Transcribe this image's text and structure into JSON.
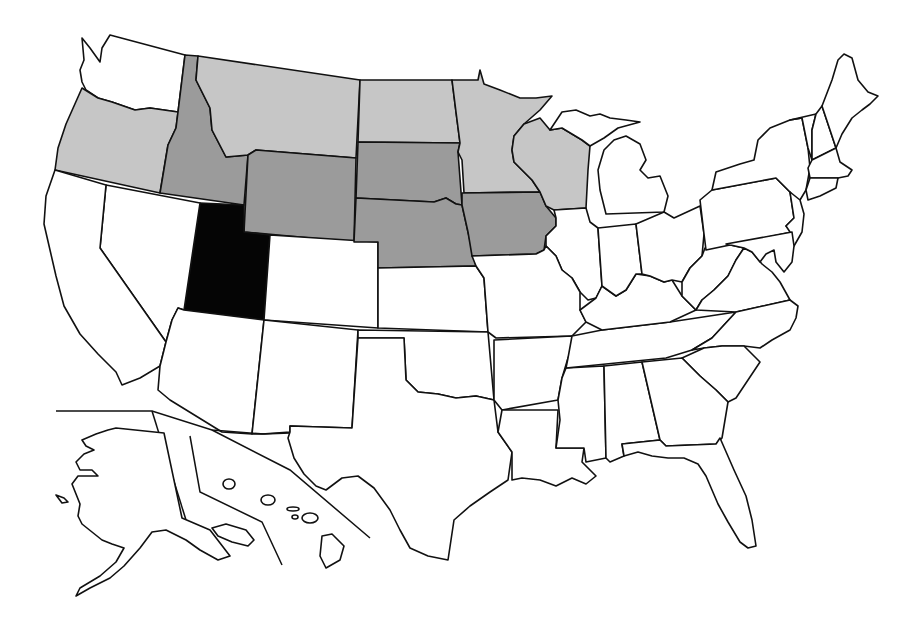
{
  "map": {
    "title": "",
    "type": "choropleth",
    "region": "United States",
    "legend": [],
    "categories": {
      "dark": {
        "color": "#050505",
        "states": [
          "UT"
        ]
      },
      "medium": {
        "color": "#9b9b9b",
        "states": [
          "ID",
          "WY",
          "SD",
          "NE",
          "IA"
        ]
      },
      "light": {
        "color": "#c6c6c6",
        "states": [
          "OR",
          "MT",
          "ND",
          "MN",
          "WI"
        ]
      },
      "none": {
        "color": "#ffffff",
        "states": [
          "WA",
          "CA",
          "NV",
          "AZ",
          "CO",
          "NM",
          "TX",
          "OK",
          "KS",
          "MO",
          "AR",
          "LA",
          "MS",
          "AL",
          "GA",
          "FL",
          "SC",
          "NC",
          "TN",
          "KY",
          "VA",
          "WV",
          "OH",
          "IN",
          "IL",
          "MI",
          "PA",
          "NY",
          "NJ",
          "DE",
          "MD",
          "CT",
          "RI",
          "MA",
          "VT",
          "NH",
          "ME",
          "AK",
          "HI"
        ]
      }
    },
    "insets": [
      "Alaska",
      "Hawaii"
    ]
  }
}
